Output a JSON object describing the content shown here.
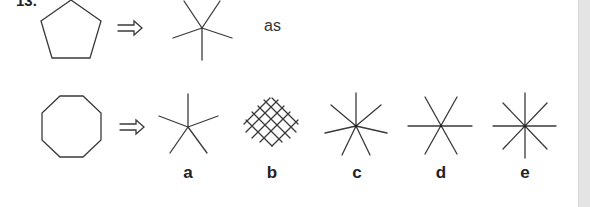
{
  "question": {
    "number": "13.",
    "example": {
      "shape": "pentagon",
      "arrow": "double-arrow-right",
      "result": "five-line-star",
      "relation_text": "as"
    },
    "problem": {
      "shape": "octagon",
      "arrow": "double-arrow-right"
    },
    "options": [
      {
        "label": "a",
        "figure": "five-line-star"
      },
      {
        "label": "b",
        "figure": "crosshatch-grid"
      },
      {
        "label": "c",
        "figure": "seven-line-star"
      },
      {
        "label": "d",
        "figure": "six-line-star"
      },
      {
        "label": "e",
        "figure": "eight-line-star"
      }
    ]
  },
  "colors": {
    "stroke": "#3a3a3a",
    "background": "#ffffff",
    "scrollbar": "#e4e4e4"
  }
}
